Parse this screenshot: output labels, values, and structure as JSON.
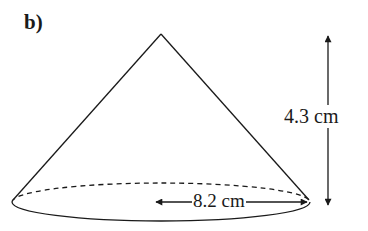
{
  "figure": {
    "part_label": "b)",
    "shape": "cone",
    "height": {
      "label": "4.3 cm",
      "value": 4.3,
      "unit": "cm"
    },
    "radius": {
      "label": "8.2 cm",
      "value": 8.2,
      "unit": "cm"
    }
  },
  "colors": {
    "stroke": "#1a1a1a",
    "background": "#ffffff"
  }
}
